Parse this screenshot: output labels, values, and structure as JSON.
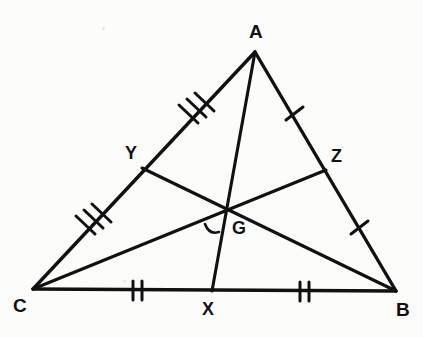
{
  "figure": {
    "kind": "geometry-diagram",
    "background_color": "#fcfcfb",
    "stroke_color": "#111111",
    "canvas": {
      "width": 423,
      "height": 337
    },
    "vertices": [
      {
        "id": "A",
        "label": "A",
        "x": 255,
        "y": 52,
        "label_x": 249,
        "label_y": 22
      },
      {
        "id": "B",
        "label": "B",
        "x": 396,
        "y": 291,
        "label_x": 396,
        "label_y": 300
      },
      {
        "id": "C",
        "label": "C",
        "x": 33,
        "y": 289,
        "label_x": 13,
        "label_y": 296
      }
    ],
    "midpoints": [
      {
        "id": "X",
        "label": "X",
        "x": 212,
        "y": 291,
        "label_x": 202,
        "label_y": 300,
        "on_segment": "CB"
      },
      {
        "id": "Y",
        "label": "Y",
        "x": 142,
        "y": 168,
        "label_x": 125,
        "label_y": 144,
        "on_segment": "CA"
      },
      {
        "id": "Z",
        "label": "Z",
        "x": 326,
        "y": 170,
        "label_x": 331,
        "label_y": 147,
        "on_segment": "AB"
      }
    ],
    "centroid": {
      "id": "G",
      "label": "G",
      "x": 225,
      "y": 211,
      "label_x": 232,
      "label_y": 219
    },
    "sides": [
      {
        "id": "CA",
        "from": "C",
        "to": "A"
      },
      {
        "id": "AB",
        "from": "A",
        "to": "B"
      },
      {
        "id": "CB",
        "from": "C",
        "to": "B"
      }
    ],
    "medians": [
      {
        "id": "AX",
        "from": "A",
        "to": "X",
        "through": "G"
      },
      {
        "id": "BY",
        "from": "B",
        "to": "Y",
        "through": "G"
      },
      {
        "id": "CZ",
        "from": "C",
        "to": "Z",
        "through": "G"
      }
    ],
    "tick_marks": [
      {
        "id": "tick-CY",
        "segment": "CY",
        "count": 3,
        "x": 89,
        "y": 224
      },
      {
        "id": "tick-YA",
        "segment": "YA",
        "count": 3,
        "x": 192,
        "y": 113
      },
      {
        "id": "tick-AZ",
        "segment": "AZ",
        "count": 1,
        "x": 294,
        "y": 114
      },
      {
        "id": "tick-ZB",
        "segment": "ZB",
        "count": 1,
        "x": 359,
        "y": 228
      },
      {
        "id": "tick-CX",
        "segment": "CX",
        "count": 2,
        "x": 137,
        "y": 290
      },
      {
        "id": "tick-XB",
        "segment": "XB",
        "count": 2,
        "x": 304,
        "y": 291
      }
    ],
    "angle_mark": {
      "id": "angle-arc-at-G",
      "x": 212,
      "y": 230
    }
  }
}
